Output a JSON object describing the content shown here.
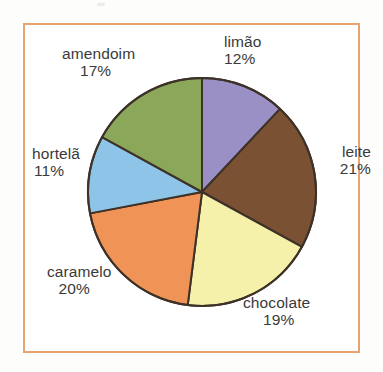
{
  "frame": {
    "border_color": "#e9a371",
    "background": "#ffffff"
  },
  "chart_data": {
    "type": "pie",
    "title": "",
    "subtitle": "",
    "xlabel": "",
    "ylabel": "",
    "legend_position": "none",
    "grid": false,
    "units": "%",
    "total": 100,
    "start_angle_deg": 0,
    "direction": "clockwise",
    "categories": [
      "limão",
      "leite",
      "chocolate",
      "caramelo",
      "hortelã",
      "amendoim"
    ],
    "values": [
      12,
      21,
      19,
      20,
      11,
      17
    ],
    "colors": [
      "#9a90c6",
      "#7a5132",
      "#f5f1ab",
      "#ef9456",
      "#8ec4e8",
      "#8ba85a"
    ],
    "slices": [
      {
        "label": "limão",
        "value": 12,
        "percent_text": "12%",
        "color": "#9a90c6",
        "start_deg": 0,
        "end_deg": 43.2
      },
      {
        "label": "leite",
        "value": 21,
        "percent_text": "21%",
        "color": "#7a5132",
        "start_deg": 43.2,
        "end_deg": 118.8
      },
      {
        "label": "chocolate",
        "value": 19,
        "percent_text": "19%",
        "color": "#f5f1ab",
        "start_deg": 118.8,
        "end_deg": 187.2
      },
      {
        "label": "caramelo",
        "value": 20,
        "percent_text": "20%",
        "color": "#ef9456",
        "start_deg": 187.2,
        "end_deg": 259.2
      },
      {
        "label": "hortelã",
        "value": 11,
        "percent_text": "11%",
        "color": "#8ec4e8",
        "start_deg": 259.2,
        "end_deg": 298.8
      },
      {
        "label": "amendoim",
        "value": 17,
        "percent_text": "17%",
        "color": "#8ba85a",
        "start_deg": 298.8,
        "end_deg": 360
      }
    ],
    "geometry": {
      "center_x": 202,
      "center_y": 192,
      "radius": 114,
      "outline_color": "#3d3128",
      "outline_width": 2
    }
  }
}
